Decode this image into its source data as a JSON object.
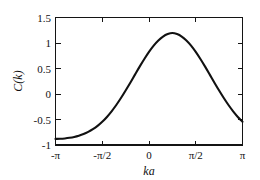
{
  "chart_data": {
    "type": "line",
    "title": "",
    "subtitle": "",
    "xlabel": "ka",
    "ylabel": "C(k)",
    "xlim": [
      -3.14159265,
      3.14159265
    ],
    "ylim": [
      -1,
      1.5
    ],
    "grid": false,
    "legend": null,
    "frame": "box",
    "tick_direction": "in",
    "line_color": "#111111",
    "background_color": "#ffffff",
    "xticks": [
      -3.14159265,
      -1.57079633,
      0,
      1.57079633,
      3.14159265
    ],
    "xticklabels": [
      "-π",
      "-π/2",
      "0",
      "π/2",
      "π"
    ],
    "yticks": [
      -1,
      -0.5,
      0,
      0.5,
      1,
      1.5
    ],
    "yticklabels": [
      "-1",
      "-0.5",
      "0",
      "0.5",
      "1",
      "1.5"
    ],
    "series": [
      {
        "name": "C(k)",
        "x": [
          -3.14159265,
          -2.98451302,
          -2.82743339,
          -2.67035376,
          -2.51327412,
          -2.35619449,
          -2.19911486,
          -2.04203522,
          -1.88495559,
          -1.72787596,
          -1.57079633,
          -1.41371669,
          -1.25663706,
          -1.09955743,
          -0.9424778,
          -0.78539816,
          -0.62831853,
          -0.4712389,
          -0.31415927,
          -0.15707963,
          0,
          0.15707963,
          0.31415927,
          0.4712389,
          0.62831853,
          0.78539816,
          0.9424778,
          1.09955743,
          1.25663706,
          1.41371669,
          1.57079633,
          1.72787596,
          1.88495559,
          2.04203522,
          2.19911486,
          2.35619449,
          2.51327412,
          2.67035376,
          2.82743339,
          2.98451302,
          3.14159265
        ],
        "y": [
          -0.88,
          -0.878,
          -0.871,
          -0.859,
          -0.842,
          -0.818,
          -0.786,
          -0.744,
          -0.691,
          -0.625,
          -0.545,
          -0.45,
          -0.34,
          -0.216,
          -0.079,
          0.068,
          0.222,
          0.38,
          0.537,
          0.687,
          0.826,
          0.949,
          1.05,
          1.126,
          1.175,
          1.196,
          1.175,
          1.126,
          1.05,
          0.949,
          0.826,
          0.687,
          0.537,
          0.38,
          0.222,
          0.068,
          -0.079,
          -0.216,
          -0.34,
          -0.45,
          -0.545
        ]
      }
    ],
    "notes": {
      "peak_value": 1.2,
      "peak_x": 0,
      "edge_value": -0.88,
      "shape": "symmetric bell-shaped cosine-like correlation function"
    }
  },
  "figure": {
    "y_axis_label": "C(k)",
    "x_axis_label": "ka",
    "y_tick_labels": [
      "1.5",
      "1",
      "0.5",
      "0",
      "-0.5",
      "-1"
    ],
    "x_tick_labels": [
      "-π",
      "-π/2",
      "0",
      "π/2",
      "π"
    ]
  }
}
